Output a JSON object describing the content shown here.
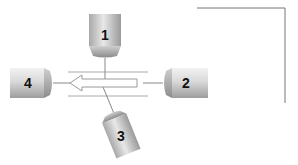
{
  "diagram": {
    "detectors": [
      {
        "id": "1",
        "label": "1",
        "orientation": "vertical-top"
      },
      {
        "id": "2",
        "label": "2",
        "orientation": "horizontal-right"
      },
      {
        "id": "3",
        "label": "3",
        "orientation": "tilted-bottom"
      },
      {
        "id": "4",
        "label": "4",
        "orientation": "horizontal-left"
      }
    ],
    "arrow": {
      "direction": "left",
      "style": "hollow"
    },
    "colors": {
      "body_light": "#e6e6e6",
      "body_dark": "#9a9a9a",
      "line": "#888888",
      "frame": "#777777",
      "label": "#111111"
    }
  }
}
